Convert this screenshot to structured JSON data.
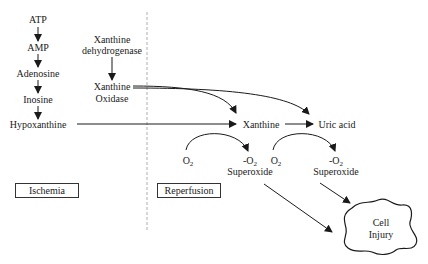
{
  "diagram": {
    "purine_chain": [
      "ATP",
      "AMP",
      "Adenosine",
      "Inosine",
      "Hypoxanthine"
    ],
    "enzyme": {
      "precursor_line1": "Xanthine",
      "precursor_line2": "dehydrogenase",
      "product_line1": "Xanthine",
      "product_line2": "Oxidase"
    },
    "metabolites": {
      "xanthine": "Xanthine",
      "uric_acid": "Uric acid"
    },
    "oxygen_reactions": [
      {
        "substrate": "O",
        "substrate_sub": "2",
        "product": "-O",
        "product_sub": "2",
        "product_name": "Superoxide"
      },
      {
        "substrate": "O",
        "substrate_sub": "2",
        "product": "-O",
        "product_sub": "2",
        "product_name": "Superoxide"
      }
    ],
    "phases": {
      "ischemia": "Ischemia",
      "reperfusion": "Reperfusion"
    },
    "outcome": {
      "line1": "Cell",
      "line2": "Injury"
    },
    "colors": {
      "line": "#1a1a1a",
      "divider": "#999999",
      "background": "#ffffff"
    }
  }
}
